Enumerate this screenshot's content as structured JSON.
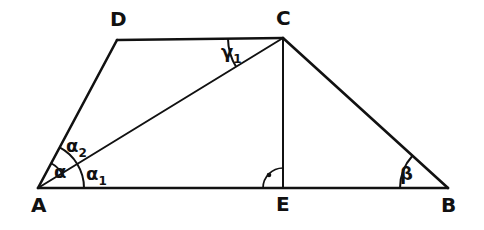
{
  "figure": {
    "background_color": "#ffffff",
    "stroke_color": "#111111"
  },
  "vertices": [
    {
      "id": "A",
      "label": "A",
      "x": 38,
      "y": 188
    },
    {
      "id": "B",
      "label": "B",
      "x": 448,
      "y": 188
    },
    {
      "id": "C",
      "label": "C",
      "x": 283,
      "y": 38
    },
    {
      "id": "D",
      "label": "D",
      "x": 117,
      "y": 40
    },
    {
      "id": "E",
      "label": "E",
      "x": 283,
      "y": 188
    }
  ],
  "vertex_labels": [
    {
      "id": "A",
      "text": "A",
      "x": 31,
      "y": 212
    },
    {
      "id": "B",
      "text": "B",
      "x": 441,
      "y": 212
    },
    {
      "id": "C",
      "text": "C",
      "x": 276,
      "y": 25
    },
    {
      "id": "D",
      "text": "D",
      "x": 110,
      "y": 26
    },
    {
      "id": "E",
      "text": "E",
      "x": 276,
      "y": 211
    }
  ],
  "edges": [
    {
      "id": "AB",
      "from": "A",
      "to": "B",
      "name": "base-ab"
    },
    {
      "id": "AD",
      "from": "A",
      "to": "D",
      "name": "side-ad"
    },
    {
      "id": "DC",
      "from": "D",
      "to": "C",
      "name": "top-dc"
    },
    {
      "id": "CB",
      "from": "C",
      "to": "B",
      "name": "side-cb"
    },
    {
      "id": "CE",
      "from": "C",
      "to": "E",
      "name": "altitude-ce"
    },
    {
      "id": "AC",
      "from": "A",
      "to": "C",
      "name": "diagonal-ac"
    }
  ],
  "angles": [
    {
      "id": "alpha",
      "label": "α",
      "sub": "",
      "vertex": "A",
      "between": [
        "AD",
        "AC"
      ],
      "radius": 28,
      "label_x": 54,
      "label_y": 178
    },
    {
      "id": "alpha2",
      "label": "α",
      "sub": "2",
      "vertex": "A",
      "between": [
        "AD",
        "AC"
      ],
      "radius": 46,
      "label_x": 66,
      "label_y": 152
    },
    {
      "id": "alpha1",
      "label": "α",
      "sub": "1",
      "vertex": "A",
      "between": [
        "AC",
        "AB"
      ],
      "radius": 46,
      "label_x": 86,
      "label_y": 180
    },
    {
      "id": "gamma1",
      "label": "γ",
      "sub": "1",
      "vertex": "C",
      "between": [
        "CD",
        "CA"
      ],
      "radius": 55,
      "label_x": 221,
      "label_y": 58
    },
    {
      "id": "beta",
      "label": "β",
      "sub": "",
      "vertex": "B",
      "between": [
        "BC",
        "BA"
      ],
      "radius": 48,
      "label_x": 400,
      "label_y": 180
    },
    {
      "id": "right-angle-e",
      "label": "",
      "sub": "",
      "vertex": "E",
      "between": [
        "EC",
        "EA"
      ],
      "radius": 20,
      "label_x": 0,
      "label_y": 0,
      "is_right_angle": true,
      "dot_x": 269,
      "dot_y": 175
    }
  ]
}
